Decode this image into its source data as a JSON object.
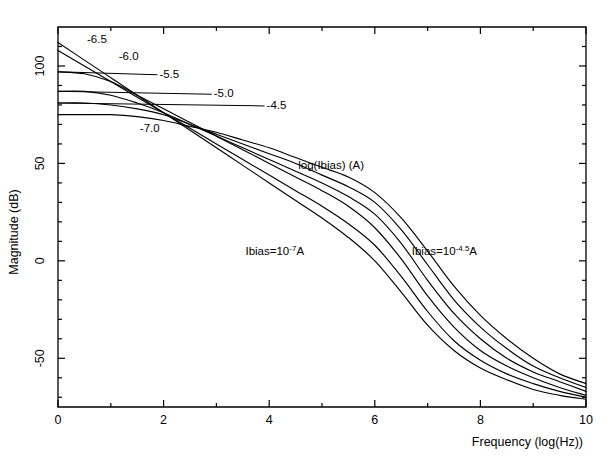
{
  "chart_data": {
    "type": "line",
    "title": "",
    "xlabel": "Frequency (log(Hz))",
    "ylabel": "Magnitude (dB)",
    "xlim": [
      0,
      10
    ],
    "ylim": [
      -75,
      120
    ],
    "grid": false,
    "legend_position": "inline-annotations",
    "x_ticks_major": [
      0,
      2,
      4,
      6,
      8,
      10
    ],
    "x_tick_labels": [
      "0",
      "2",
      "4",
      "6",
      "8",
      "10"
    ],
    "x_ticks_minor": [
      1,
      3,
      5,
      7,
      9
    ],
    "y_ticks_major": [
      100,
      50,
      0,
      -50
    ],
    "y_tick_labels": [
      "100",
      "50",
      "0",
      "-50"
    ],
    "y_ticks_minor": [
      110,
      90,
      80,
      70,
      60,
      40,
      30,
      20,
      10,
      -10,
      -20,
      -30,
      -40,
      -60,
      -70
    ],
    "series_parameter_name": "log(Ibias) (A)",
    "series": [
      {
        "name": "-7.0",
        "label": "-7.0",
        "dc_gain_db": 112,
        "x": [
          0,
          0.5,
          1,
          1.5,
          2,
          2.5,
          3,
          3.5,
          4,
          4.5,
          5,
          5.5,
          6,
          6.5,
          7,
          7.5,
          8,
          8.5,
          9,
          9.5,
          10
        ],
        "values": [
          112,
          103,
          94,
          85,
          76,
          67,
          58,
          49,
          40,
          31,
          22,
          12,
          0,
          -16,
          -33,
          -46,
          -55,
          -61,
          -66,
          -69,
          -71
        ]
      },
      {
        "name": "-6.5",
        "label": "-6.5",
        "dc_gain_db": 108,
        "x": [
          0,
          0.5,
          1,
          1.5,
          2,
          2.5,
          3,
          3.5,
          4,
          4.5,
          5,
          5.5,
          6,
          6.5,
          7,
          7.5,
          8,
          8.5,
          9,
          9.5,
          10
        ],
        "values": [
          108,
          100,
          92,
          84,
          76,
          68,
          60,
          52,
          44,
          36,
          28,
          19,
          8,
          -8,
          -26,
          -41,
          -51,
          -58,
          -63,
          -67,
          -70
        ]
      },
      {
        "name": "-6.0",
        "label": "-6.0",
        "dc_gain_db": 97,
        "x": [
          0,
          0.5,
          1,
          1.5,
          2,
          2.5,
          3,
          3.5,
          4,
          4.5,
          5,
          5.5,
          6,
          6.5,
          7,
          7.5,
          8,
          8.5,
          9,
          9.5,
          10
        ],
        "values": [
          97,
          96,
          92,
          85,
          78,
          71,
          64,
          57,
          50,
          43,
          36,
          28,
          17,
          1,
          -18,
          -34,
          -46,
          -54,
          -60,
          -65,
          -69
        ]
      },
      {
        "name": "-5.5",
        "label": "-5.5",
        "dc_gain_db": 87,
        "x": [
          0,
          0.5,
          1,
          1.5,
          2,
          2.5,
          3,
          3.5,
          4,
          4.5,
          5,
          5.5,
          6,
          6.5,
          7,
          7.5,
          8,
          8.5,
          9,
          9.5,
          10
        ],
        "values": [
          87,
          87,
          85,
          81,
          76,
          70,
          64,
          58,
          52,
          46,
          40,
          33,
          24,
          9,
          -10,
          -27,
          -40,
          -50,
          -57,
          -62,
          -67
        ]
      },
      {
        "name": "-5.0",
        "label": "-5.0",
        "dc_gain_db": 81,
        "x": [
          0,
          0.5,
          1,
          1.5,
          2,
          2.5,
          3,
          3.5,
          4,
          4.5,
          5,
          5.5,
          6,
          6.5,
          7,
          7.5,
          8,
          8.5,
          9,
          9.5,
          10
        ],
        "values": [
          81,
          81,
          80,
          78,
          75,
          70,
          65,
          60,
          55,
          50,
          44,
          38,
          30,
          16,
          -2,
          -20,
          -34,
          -45,
          -54,
          -60,
          -65
        ]
      },
      {
        "name": "-4.5",
        "label": "-4.5",
        "dc_gain_db": 75,
        "x": [
          0,
          0.5,
          1,
          1.5,
          2,
          2.5,
          3,
          3.5,
          4,
          4.5,
          5,
          5.5,
          6,
          6.5,
          7,
          7.5,
          8,
          8.5,
          9,
          9.5,
          10
        ],
        "values": [
          75,
          75,
          75,
          74,
          72,
          69,
          66,
          62,
          58,
          53,
          48,
          43,
          35,
          22,
          5,
          -13,
          -28,
          -40,
          -50,
          -58,
          -63
        ]
      }
    ],
    "annotations": [
      {
        "name": "parameter-title",
        "text": "log(Ibias) (A)",
        "x": 4.55,
        "y": 47
      },
      {
        "name": "ibias-low",
        "text": "Ibias=10",
        "sup": "-7",
        "tail": "A",
        "x": 3.55,
        "y": 3
      },
      {
        "name": "ibias-high",
        "text": "Ibias=10",
        "sup": "-4.5",
        "tail": "A",
        "x": 6.7,
        "y": 3
      }
    ],
    "curve_labels": [
      {
        "name": "label-6.5",
        "text": "-6.5",
        "tx": 0.55,
        "ty": 114,
        "leader": false
      },
      {
        "name": "label-6.0",
        "text": "-6.0",
        "tx": 1.15,
        "ty": 105,
        "leader": false
      },
      {
        "name": "label-5.5",
        "text": "-5.5",
        "tx": 1.92,
        "ty": 96,
        "leader": true,
        "lx": 0.0,
        "ly": 97
      },
      {
        "name": "label-5.0",
        "text": "-5.0",
        "tx": 2.95,
        "ty": 86,
        "leader": true,
        "lx": 0.0,
        "ly": 87
      },
      {
        "name": "label-4.5",
        "text": "-4.5",
        "tx": 3.95,
        "ty": 80,
        "leader": true,
        "lx": 0.0,
        "ly": 81
      },
      {
        "name": "label-7.0",
        "text": "-7.0",
        "tx": 1.55,
        "ty": 68,
        "leader": false
      }
    ]
  },
  "axes": {
    "x_title": "Frequency (log(Hz))",
    "y_title": "Magnitude (dB)"
  }
}
